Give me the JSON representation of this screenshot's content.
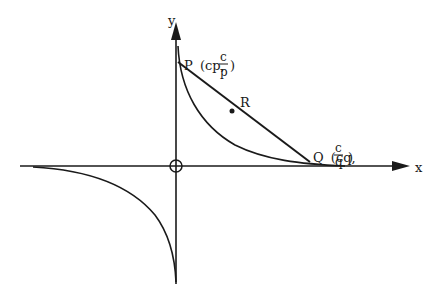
{
  "diagram": {
    "type": "rectangular hyperbola xy = c^2 with chord PQ",
    "axes": {
      "x_label": "x",
      "y_label": "y"
    },
    "points": {
      "P": {
        "name": "P",
        "coords_prefix": "(cp,",
        "frac_num": "c",
        "frac_den": "p",
        "coords_suffix": ")"
      },
      "Q": {
        "name": "Q",
        "coords_prefix": "(cq,",
        "frac_num": "c",
        "frac_den": "q",
        "coords_suffix": ")"
      },
      "R": {
        "name": "R"
      }
    },
    "colors": {
      "stroke": "#1a1a1a",
      "background": "#ffffff"
    }
  }
}
